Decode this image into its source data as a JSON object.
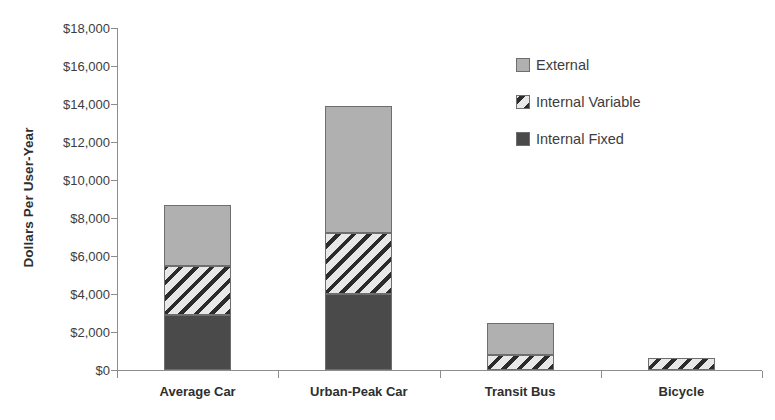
{
  "chart_data": {
    "type": "bar",
    "subtype": "stacked-bar",
    "title": "",
    "xlabel": "",
    "ylabel": "Dollars Per User-Year",
    "ylim": [
      0,
      18000
    ],
    "ytick_step": 2000,
    "ytick_labels": [
      "$18,000",
      "$16,000",
      "$14,000",
      "$12,000",
      "$10,000",
      "$8,000",
      "$6,000",
      "$4,000",
      "$2,000",
      "$0"
    ],
    "ytick_values": [
      18000,
      16000,
      14000,
      12000,
      10000,
      8000,
      6000,
      4000,
      2000,
      0
    ],
    "grid": false,
    "legend_position": "upper-right-inside",
    "categories": [
      "Average Car",
      "Urban-Peak Car",
      "Transit Bus",
      "Bicycle"
    ],
    "series": [
      {
        "name": "Internal Fixed",
        "color": "#4a4a4a",
        "pattern": "solid-dark",
        "values": [
          2900,
          4000,
          0,
          0
        ]
      },
      {
        "name": "Internal Variable",
        "color": "#d9d9d9",
        "pattern": "diagonal-hatch",
        "values": [
          2600,
          3200,
          800,
          650
        ]
      },
      {
        "name": "External",
        "color": "#b0b0b0",
        "pattern": "solid-light",
        "values": [
          3200,
          6700,
          1700,
          0
        ]
      }
    ],
    "totals": [
      8700,
      13900,
      2500,
      650
    ]
  },
  "legend": {
    "items": [
      {
        "label": "External",
        "swatch": "external-swatch"
      },
      {
        "label": "Internal Variable",
        "swatch": "internal-variable-swatch"
      },
      {
        "label": "Internal Fixed",
        "swatch": "internal-fixed-swatch"
      }
    ]
  },
  "colors": {
    "external": "#b0b0b0",
    "internal_variable_light": "#e8e8e8",
    "internal_variable_dark": "#2b2b2b",
    "internal_fixed": "#4a4a4a",
    "axis": "#8d8d8d",
    "text": "#3d3d3d",
    "background": "#ffffff"
  }
}
